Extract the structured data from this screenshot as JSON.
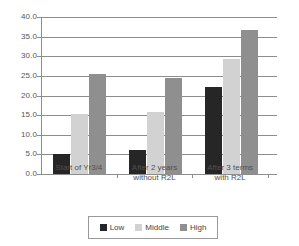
{
  "chart_data": {
    "type": "bar",
    "title": "",
    "xlabel": "",
    "ylabel": "",
    "grid": true,
    "legend_position": "bottom",
    "ylim": [
      0.0,
      40.0
    ],
    "ytick_step": 5.0,
    "ytick_labels": [
      "40.0",
      "35.0",
      "30.0",
      "25.0",
      "20.0",
      "15.0",
      "10.0",
      "5.0",
      "0.0"
    ],
    "ytick_values": [
      40.0,
      35.0,
      30.0,
      25.0,
      20.0,
      15.0,
      10.0,
      5.0,
      0.0
    ],
    "categories": [
      "Start of Yr3/4",
      "After 2 years without R2L",
      "After 3 terms with R2L"
    ],
    "category_lines": [
      [
        "Start of Yr3/4"
      ],
      [
        "After 2 years",
        "without R2L"
      ],
      [
        "After 3 terms",
        "with R2L"
      ]
    ],
    "series": [
      {
        "name": "Low",
        "color": "#262626",
        "values": [
          5.0,
          6.2,
          22.2
        ]
      },
      {
        "name": "Middle",
        "color": "#d2d2d2",
        "values": [
          15.3,
          15.7,
          29.4
        ]
      },
      {
        "name": "High",
        "color": "#8f8f8f",
        "values": [
          25.6,
          24.5,
          36.8
        ]
      }
    ]
  },
  "legend": {
    "items": [
      {
        "label": "Low"
      },
      {
        "label": "Middle"
      },
      {
        "label": "High"
      }
    ]
  },
  "colors": {
    "low": "#262626",
    "middle": "#d2d2d2",
    "high": "#8f8f8f",
    "axis": "#8d8d8d",
    "background": "#ffffff"
  }
}
